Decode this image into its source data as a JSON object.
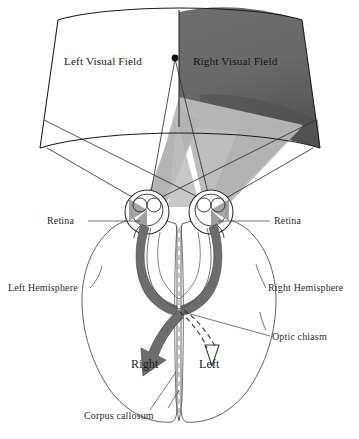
{
  "figure": {
    "type": "anatomical-diagram"
  },
  "visual_field": {
    "left_field_label": "Left Visual Field",
    "right_field_label": "Right Visual Field",
    "fixation_point_name": "fixation-point",
    "left_field_fill": "#ffffff",
    "right_field_fill": "#6e6e6e",
    "right_field_fill_dark": "#5a5a5a",
    "cone_fill": "#b4b4b4",
    "outline_color": "#1c1c1c"
  },
  "brain": {
    "left_hemisphere_label": "Left Hemisphere",
    "right_hemisphere_label": "Right Hemisphere",
    "corpus_callosum_label": "Corpus callosum",
    "optic_chiasm_label": "Optic chiasm",
    "retina_left_label": "Retina",
    "retina_right_label": "Retina",
    "outline_color": "#4a4a4a",
    "tract_fill": "#6b6b6b"
  },
  "arrows": {
    "right_arrow_label": "Right",
    "left_arrow_label": "Left",
    "solid_arrow_fill": "#6b6b6b",
    "dashed_arrow_stroke": "#3a3a3a"
  }
}
